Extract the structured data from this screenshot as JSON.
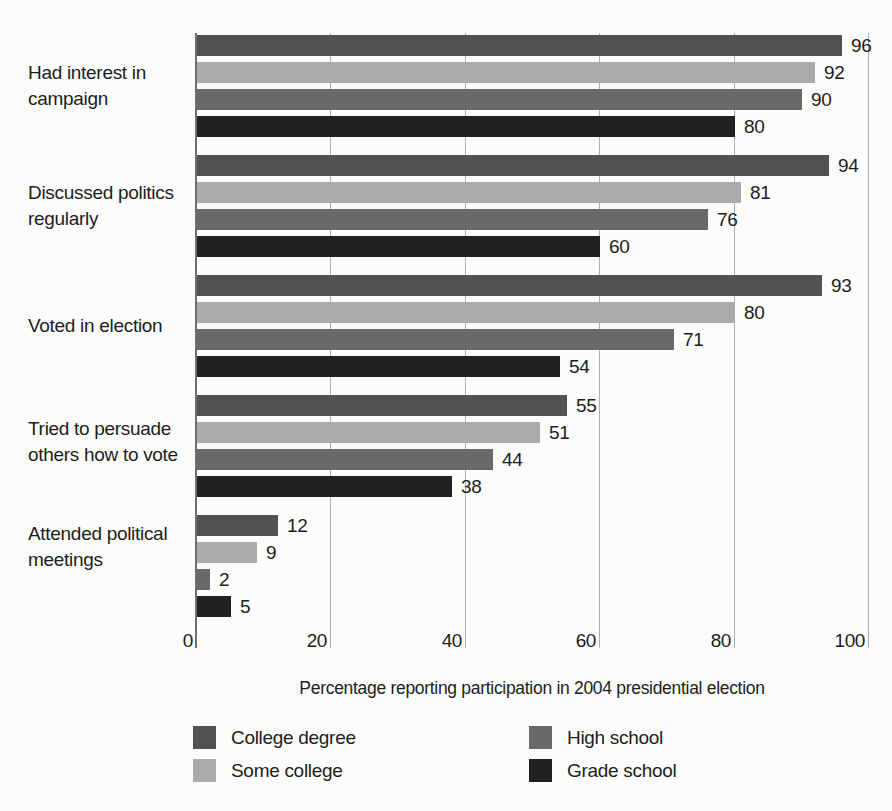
{
  "chart_data": {
    "type": "bar",
    "orientation": "horizontal",
    "title": "",
    "xlabel": "Percentage reporting participation in 2004 presidential election",
    "ylabel": "",
    "xlim": [
      0,
      100
    ],
    "xticks": [
      0,
      20,
      40,
      60,
      80,
      100
    ],
    "grid": "vertical gridlines at each x tick, drawn behind bars",
    "legend_position": "bottom, two columns",
    "categories": [
      "Had interest in\ncampaign",
      "Discussed politics\nregularly",
      "Voted in election",
      "Tried to persuade\nothers how to vote",
      "Attended political\nmeetings"
    ],
    "series": [
      {
        "name": "College degree",
        "color": "#525252",
        "values": [
          96,
          94,
          93,
          55,
          12
        ]
      },
      {
        "name": "Some college",
        "color": "#ababab",
        "values": [
          92,
          81,
          80,
          51,
          9
        ]
      },
      {
        "name": "High school",
        "color": "#696969",
        "values": [
          90,
          76,
          71,
          44,
          2
        ]
      },
      {
        "name": "Grade school",
        "color": "#222222",
        "values": [
          80,
          60,
          54,
          38,
          5
        ]
      }
    ],
    "bar_value_labels_shown": true,
    "colors": {
      "gridline": "#aeaeae",
      "zero_axis": "#6e6e6e",
      "text": "#1d1d1d",
      "background": "#fcfcfb"
    }
  },
  "legend": {
    "columns": [
      [
        "College degree",
        "Some college"
      ],
      [
        "High school",
        "Grade school"
      ]
    ]
  }
}
